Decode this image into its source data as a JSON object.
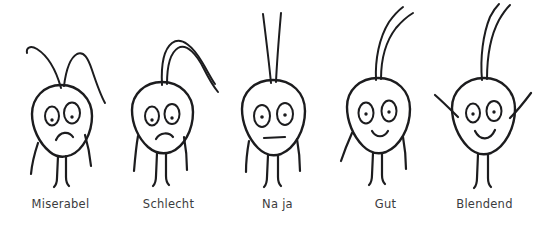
{
  "graphic": {
    "kind": "hand-drawn-mood-rating-scale",
    "background_color": "#ffffff",
    "ink_color": "#1c1c1e",
    "label_color": "#3b3b3d",
    "count": 5
  },
  "figures": [
    {
      "label": "Miserabel",
      "rank": 1,
      "mood": "very-bad",
      "mouth": "deep-frown",
      "antennae": "both-drooping-down-hooked",
      "arms": "hanging-down",
      "legs": "two-straight"
    },
    {
      "label": "Schlecht",
      "rank": 2,
      "mood": "bad",
      "mouth": "slight-frown",
      "antennae": "both-arcing-over-to-the-right",
      "arms": "hanging-down",
      "legs": "two-straight"
    },
    {
      "label": "Na ja",
      "rank": 3,
      "mood": "neutral",
      "mouth": "straight-line",
      "antennae": "both-straight-upright",
      "arms": "hanging-down",
      "legs": "two-straight"
    },
    {
      "label": "Gut",
      "rank": 4,
      "mood": "good",
      "mouth": "small-smile",
      "antennae": "both-upright-curving-right",
      "arms": "hanging-down",
      "legs": "two-straight"
    },
    {
      "label": "Blendend",
      "rank": 5,
      "mood": "excellent",
      "mouth": "wide-smile",
      "antennae": "both-upright-tall",
      "arms": "raised-up-in-v",
      "legs": "two-straight"
    }
  ]
}
